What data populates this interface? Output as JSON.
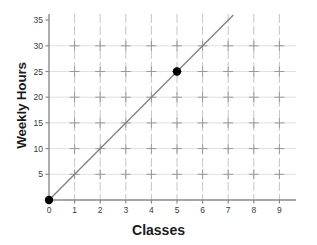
{
  "chart_data": {
    "type": "line",
    "title": "",
    "xlabel": "Classes",
    "ylabel": "Weekly Hours",
    "xlim": [
      0,
      9.6
    ],
    "ylim": [
      0,
      36.5
    ],
    "xticks": [
      "0",
      "1",
      "2",
      "3",
      "4",
      "5",
      "6",
      "7",
      "8",
      "9"
    ],
    "xtick_values": [
      0,
      1,
      2,
      3,
      4,
      5,
      6,
      7,
      8,
      9
    ],
    "yticks": [
      "5",
      "10",
      "15",
      "20",
      "25",
      "30",
      "35"
    ],
    "ytick_values": [
      5,
      10,
      15,
      20,
      25,
      30,
      35
    ],
    "grid": true,
    "grid_x_values": [
      1,
      2,
      3,
      4,
      5,
      6,
      7,
      8,
      9
    ],
    "grid_y_values": [
      5,
      10,
      15,
      20,
      25,
      30
    ],
    "legend": "none",
    "series": [
      {
        "name": "weekly hours per class",
        "type": "line",
        "slope": 5,
        "intercept": 0,
        "equation": "y = 5x",
        "x": [
          0,
          7.2
        ],
        "y": [
          0,
          36
        ],
        "color": "#808080"
      }
    ],
    "points": [
      {
        "label": "origin",
        "x": 0,
        "y": 0,
        "color": "#000000"
      },
      {
        "label": "marked-point",
        "x": 5,
        "y": 25,
        "color": "#000000"
      }
    ],
    "colors": {
      "background": "#ffffff",
      "axis": "#8a8a8a",
      "gridline": "#b4b4b4",
      "gridline_faint": "#e0e0e0",
      "line": "#808080",
      "point": "#000000",
      "tick_text": "#3a3a3a",
      "axis_label_text": "#1a1a1a"
    }
  },
  "axes": {
    "x_title": "Classes",
    "y_title": "Weekly Hours"
  }
}
